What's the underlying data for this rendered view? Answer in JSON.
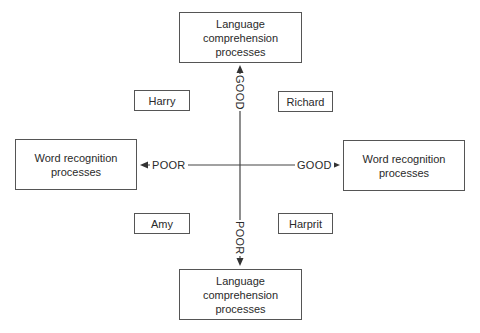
{
  "diagram": {
    "boxes": {
      "top": "Language\ncomprehension\nprocesses",
      "bottom": "Language\ncomprehension\nprocesses",
      "left": "Word recognition\nprocesses",
      "right": "Word recognition\nprocesses"
    },
    "axis_labels": {
      "up": "GOOD",
      "down": "POOR",
      "left": "POOR",
      "right": "GOOD"
    },
    "quadrants": {
      "top_left": "Harry",
      "top_right": "Richard",
      "bottom_left": "Amy",
      "bottom_right": "Harprit"
    },
    "colors": {
      "line": "#444444",
      "border": "#555555",
      "text": "#2a2a2a"
    }
  }
}
